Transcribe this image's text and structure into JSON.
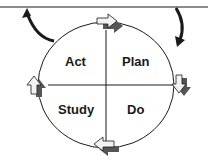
{
  "diagram": {
    "type": "cycle",
    "title": "",
    "quadrants": [
      {
        "id": "act",
        "label": "Act",
        "position": "top-left"
      },
      {
        "id": "plan",
        "label": "Plan",
        "position": "top-right"
      },
      {
        "id": "study",
        "label": "Study",
        "position": "bottom-left"
      },
      {
        "id": "do",
        "label": "Do",
        "position": "bottom-right"
      }
    ],
    "flow": [
      "Plan",
      "Do",
      "Study",
      "Act"
    ],
    "direction": "clockwise",
    "cycle_arrows": [
      {
        "position": "top",
        "direction": "right"
      },
      {
        "position": "right",
        "direction": "down"
      },
      {
        "position": "bottom",
        "direction": "left"
      },
      {
        "position": "left",
        "direction": "up"
      }
    ],
    "connector_arrows": [
      {
        "from": "circle-top-left",
        "to": "baseline",
        "direction": "up"
      },
      {
        "from": "baseline",
        "to": "circle-top-right",
        "direction": "down"
      }
    ],
    "colors": {
      "line": "#1a1a1a",
      "arrow_fill": "#f2f2f2",
      "arrow_shadow": "#555555",
      "background": "#ffffff"
    }
  }
}
